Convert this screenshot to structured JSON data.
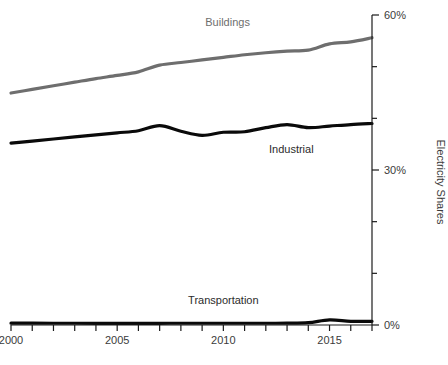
{
  "chart_data": {
    "type": "line",
    "title": "",
    "xlabel": "",
    "ylabel": "Electricity Shares",
    "xlim": [
      2000,
      2017
    ],
    "ylim": [
      0,
      60
    ],
    "grid": false,
    "legend_position": "inline-annotations",
    "y_axis_side": "right",
    "y_ticks_major": [
      0,
      30,
      60
    ],
    "y_ticklabels_major": [
      "0%",
      "30%",
      "60%"
    ],
    "y_ticks_minor": [
      10,
      20,
      40,
      50
    ],
    "x_ticks": [
      2000,
      2001,
      2002,
      2003,
      2004,
      2005,
      2006,
      2007,
      2008,
      2009,
      2010,
      2011,
      2012,
      2013,
      2014,
      2015,
      2016,
      2017
    ],
    "x_ticklabels": [
      "2000",
      "",
      "",
      "",
      "",
      "2005",
      "",
      "",
      "",
      "",
      "2010",
      "",
      "",
      "",
      "",
      "2015",
      "",
      ""
    ],
    "x": [
      2000,
      2001,
      2002,
      2003,
      2004,
      2005,
      2006,
      2007,
      2008,
      2009,
      2010,
      2011,
      2012,
      2013,
      2014,
      2015,
      2016,
      2017
    ],
    "series": [
      {
        "name": "Buildings",
        "color": "#6e6e6e",
        "values": [
          44.9,
          45.6,
          46.3,
          47.0,
          47.7,
          48.3,
          49.0,
          50.3,
          50.8,
          51.3,
          51.8,
          52.3,
          52.7,
          53.0,
          53.2,
          54.4,
          54.8,
          55.6
        ],
        "label_x": 2010.2,
        "label_y": 57.8
      },
      {
        "name": "Industrial",
        "color": "#0a0a0a",
        "values": [
          35.2,
          35.6,
          36.0,
          36.4,
          36.8,
          37.2,
          37.6,
          38.6,
          37.5,
          36.7,
          37.3,
          37.4,
          38.2,
          38.8,
          38.2,
          38.5,
          38.8,
          39.0
        ],
        "label_x": 2013.2,
        "label_y": 33.3
      },
      {
        "name": "Transportation",
        "color": "#0a0a0a",
        "values": [
          0.35,
          0.35,
          0.34,
          0.34,
          0.33,
          0.33,
          0.33,
          0.33,
          0.34,
          0.34,
          0.34,
          0.34,
          0.34,
          0.35,
          0.45,
          1.0,
          0.72,
          0.72
        ],
        "label_x": 2010.0,
        "label_y": 4.1
      }
    ]
  },
  "axis": {
    "y_title": "Electricity Shares",
    "y_label_top": "60%",
    "y_label_mid": "30%",
    "y_label_bottom": "0%",
    "x_label_1": "2000",
    "x_label_2": "2005",
    "x_label_3": "2010",
    "x_label_4": "2015"
  }
}
